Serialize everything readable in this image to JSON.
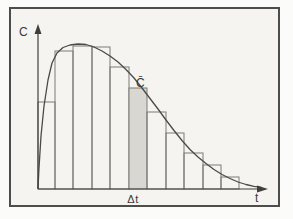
{
  "figure": {
    "labels": {
      "y_axis": "C",
      "x_axis": "t",
      "interval": "Δt",
      "mean_concentration": "C̄"
    },
    "colors": {
      "frame_border": "#4d4d4b",
      "paper": "#f5f4f0",
      "bar_outline": "#7c7b77",
      "shaded_bar_fill": "#d8d7d1",
      "curve": "#4a4a48",
      "axis": "#3f3f3d",
      "text": "#3a3a38"
    },
    "plot": {
      "baseline": 189,
      "axes": {
        "y": {
          "x": 38,
          "top": 30,
          "bottom": 189,
          "arrow_tip_y": 24
        },
        "x": {
          "y": 189,
          "left": 38,
          "right": 261,
          "arrow_tip_x": 268
        }
      },
      "bars": [
        {
          "x": 38,
          "w": 17,
          "top": 102,
          "shaded": false
        },
        {
          "x": 55,
          "w": 18,
          "top": 51,
          "shaded": false
        },
        {
          "x": 73,
          "w": 19,
          "top": 46,
          "shaded": false
        },
        {
          "x": 92,
          "w": 18,
          "top": 47,
          "shaded": false
        },
        {
          "x": 110,
          "w": 19,
          "top": 67,
          "shaded": false
        },
        {
          "x": 129,
          "w": 18,
          "top": 88,
          "shaded": true
        },
        {
          "x": 147,
          "w": 19,
          "top": 112,
          "shaded": false
        },
        {
          "x": 166,
          "w": 18,
          "top": 133,
          "shaded": false
        },
        {
          "x": 184,
          "w": 19,
          "top": 153,
          "shaded": false
        },
        {
          "x": 203,
          "w": 18,
          "top": 165,
          "shaded": false
        },
        {
          "x": 221,
          "w": 18,
          "top": 177,
          "shaded": false
        }
      ],
      "curve_points": [
        [
          38,
          188
        ],
        [
          39,
          168
        ],
        [
          41,
          136
        ],
        [
          44,
          106
        ],
        [
          48,
          80
        ],
        [
          52,
          63
        ],
        [
          57,
          53
        ],
        [
          63,
          47.5
        ],
        [
          70,
          45
        ],
        [
          78,
          44
        ],
        [
          86,
          44.5
        ],
        [
          94,
          47
        ],
        [
          102,
          51
        ],
        [
          110,
          56
        ],
        [
          118,
          62
        ],
        [
          126,
          69.5
        ],
        [
          134,
          78
        ],
        [
          142,
          88
        ],
        [
          150,
          98.5
        ],
        [
          158,
          109
        ],
        [
          166,
          120
        ],
        [
          174,
          130.5
        ],
        [
          182,
          140.5
        ],
        [
          190,
          149.5
        ],
        [
          198,
          157
        ],
        [
          206,
          163.5
        ],
        [
          214,
          169.5
        ],
        [
          222,
          174.5
        ],
        [
          230,
          178.5
        ],
        [
          238,
          182
        ],
        [
          246,
          184.5
        ],
        [
          254,
          186.3
        ],
        [
          261,
          187.4
        ]
      ]
    }
  }
}
